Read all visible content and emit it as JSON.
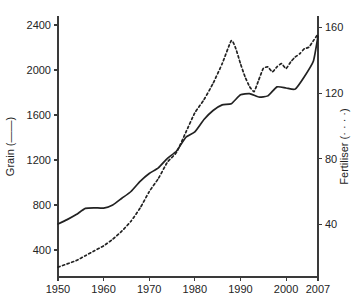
{
  "chart_data": {
    "type": "line",
    "title": "",
    "xlabel": "",
    "ylabel": "Grain (——)",
    "y2label": "Fertiliser (· · · ·)",
    "grid": false,
    "legend": "inline-in-axis-titles",
    "xlim": [
      1950,
      2007
    ],
    "xticks": [
      1950,
      1960,
      1970,
      1980,
      1990,
      2000,
      2007
    ],
    "xticklabels": [
      "1950",
      "1960",
      "1970",
      "1980",
      "1990",
      "2000",
      "2007"
    ],
    "ylim": [
      160,
      2480
    ],
    "yticks": [
      400,
      800,
      1200,
      1600,
      2000,
      2400
    ],
    "yticklabels": [
      "400",
      "800",
      "1200",
      "1600",
      "2000",
      "2400"
    ],
    "y2lim": [
      8,
      167
    ],
    "y2ticks": [
      40,
      80,
      120,
      160
    ],
    "y2ticklabels": [
      "40",
      "80",
      "120",
      "160"
    ],
    "series": [
      {
        "name": "Grain",
        "axis": "left",
        "style": "solid",
        "x": [
          1950,
          1952,
          1954,
          1956,
          1958,
          1960,
          1962,
          1964,
          1966,
          1968,
          1970,
          1972,
          1974,
          1976,
          1978,
          1980,
          1982,
          1984,
          1986,
          1988,
          1990,
          1992,
          1994,
          1996,
          1998,
          2000,
          2002,
          2004,
          2006,
          2007
        ],
        "values": [
          631,
          670,
          715,
          770,
          775,
          772,
          800,
          860,
          920,
          1010,
          1080,
          1130,
          1215,
          1280,
          1400,
          1450,
          1560,
          1640,
          1690,
          1700,
          1780,
          1790,
          1760,
          1770,
          1850,
          1840,
          1830,
          1940,
          2080,
          2300
        ]
      },
      {
        "name": "Fertiliser",
        "axis": "right",
        "style": "dashed",
        "x": [
          1950,
          1952,
          1954,
          1956,
          1958,
          1960,
          1962,
          1964,
          1966,
          1968,
          1970,
          1972,
          1974,
          1976,
          1978,
          1980,
          1982,
          1984,
          1986,
          1988,
          1989,
          1990,
          1991,
          1992,
          1993,
          1994,
          1995,
          1996,
          1997,
          1998,
          1999,
          2000,
          2001,
          2002,
          2003,
          2004,
          2005,
          2006,
          2007
        ],
        "values": [
          14,
          16,
          18,
          21,
          24,
          27,
          31,
          36,
          42,
          50,
          60,
          68,
          78,
          84,
          96,
          108,
          116,
          126,
          138,
          152,
          147,
          138,
          130,
          124,
          121,
          128,
          135,
          136,
          133,
          136,
          138,
          135,
          139,
          142,
          144,
          147,
          148,
          152,
          156
        ]
      }
    ]
  },
  "figure": {
    "plot_left_px": 58,
    "plot_right_px": 318,
    "plot_top_px": 16,
    "plot_bottom_px": 277
  }
}
